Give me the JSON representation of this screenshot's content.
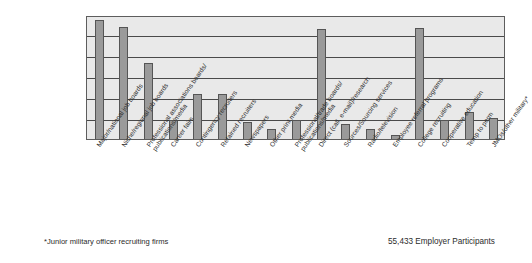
{
  "chart_data": {
    "type": "bar",
    "title": "",
    "subtitle": "",
    "xlabel": "",
    "ylabel": "",
    "grid": true,
    "gridlines": 5,
    "legend": "none",
    "ylim": [
      0,
      6
    ],
    "categories": [
      "Major/national job boards",
      "Niche/regional job boards",
      "Professional associations boards/publications/media",
      "Career fairs",
      "Contingency recruiters",
      "Retained recruiters",
      "Newspapers",
      "Other print media",
      "Professional/trade boards/publications/media",
      "Direct (call, e-mail)/research",
      "Sources/Sourcing services",
      "Radio/television",
      "Employee referral programs",
      "College recruiting",
      "Cooperative education",
      "Temp to perm",
      "JMOs/other military*"
    ],
    "category_lines": [
      [
        "Major/national job boards"
      ],
      [
        "Niche/regional job boards"
      ],
      [
        "Professional associations boards/",
        "publications/media"
      ],
      [
        "Career fairs"
      ],
      [
        "Contingency recruiters"
      ],
      [
        "Retained recruiters"
      ],
      [
        "Newspapers"
      ],
      [
        "Other print media"
      ],
      [
        "Professional/trade boards/",
        "publications/media"
      ],
      [
        "Direct (call, e-mail)/research"
      ],
      [
        "Sources/Sourcing services"
      ],
      [
        "Radio/television"
      ],
      [
        "Employee referral programs"
      ],
      [
        "College recruiting"
      ],
      [
        "Cooperative education"
      ],
      [
        "Temp to perm"
      ],
      [
        "JMOs/other military*"
      ]
    ],
    "values": [
      5.75,
      5.4,
      3.7,
      0.9,
      2.2,
      2.2,
      0.8,
      0.5,
      0.9,
      5.3,
      0.75,
      0.5,
      0.2,
      5.35,
      0.9,
      1.3,
      1.0
    ],
    "colors": {
      "bar_fill": "#9a9a9a",
      "bar_border": "#555555",
      "plot_background": "#e9e9e9",
      "gridline": "#4a4a4a",
      "frame_border": "#5d5d5d",
      "text": "#2b2b2b"
    }
  },
  "footer": {
    "footnote": "*Junior military officer recruiting firms",
    "participants": "55,433 Employer Participants"
  }
}
